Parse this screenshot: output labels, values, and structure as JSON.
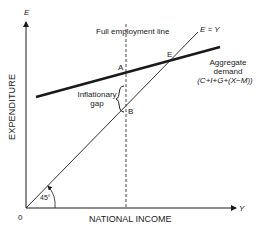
{
  "diagram": {
    "axes": {
      "y_axis_symbol": "E",
      "x_axis_symbol": "Y",
      "y_label": "EXPENDITURE",
      "x_label": "NATIONAL INCOME",
      "origin_label": "0"
    },
    "lines": {
      "full_employment_label": "Full employment line",
      "forty_five_label": "E = Y",
      "angle_label": "45°",
      "aggregate_demand_label_1": "Aggregate",
      "aggregate_demand_label_2": "demand",
      "aggregate_demand_label_3": "(C+I+G+(X−M))"
    },
    "points": {
      "A": "A",
      "B": "B",
      "E": "E"
    },
    "gap": {
      "label_1": "Inflationary",
      "label_2": "gap"
    },
    "colors": {
      "line": "#1a1a1a",
      "background": "#ffffff"
    }
  }
}
